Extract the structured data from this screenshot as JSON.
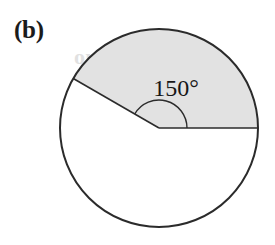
{
  "figure": {
    "part_label": "(b)",
    "angle_label": "150°",
    "background_color": "#ffffff",
    "stroke_color": "#2b2b2b",
    "shaded_fill_color": "#e2e2e2",
    "unshaded_fill_color": "#ffffff",
    "label_color": "#1b1b1b"
  },
  "chart_data": {
    "type": "pie",
    "title": "",
    "subtitle": "",
    "xlabel": "",
    "ylabel": "",
    "categories": [
      "Shaded sector",
      "Unshaded sector"
    ],
    "values": [
      150,
      210
    ],
    "value_unit": "degrees",
    "data_labels": [
      "150°",
      ""
    ],
    "colors": [
      "#e2e2e2",
      "#ffffff"
    ],
    "legend": [],
    "legend_position": "none",
    "grid": false,
    "annotations": [
      {
        "text": "(b)",
        "x": 17,
        "y": 22,
        "role": "part-label"
      },
      {
        "text": "150°",
        "x": 176,
        "y": 91,
        "role": "central-angle-measure"
      }
    ],
    "geometry": {
      "center_x": 159,
      "center_y": 128,
      "radius": 99,
      "start_angle_deg": 0,
      "sweep_angle_deg": 150,
      "direction": "counterclockwise",
      "arc_marker_radius": 28
    }
  },
  "ghost": {
    "line1": "out at the beg",
    "line2": "ty Angles"
  }
}
